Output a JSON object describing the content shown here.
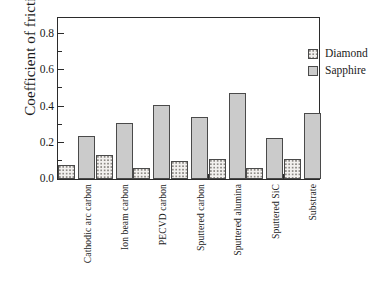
{
  "chart_data": {
    "type": "bar",
    "title": "",
    "xlabel": "",
    "ylabel": "Coefficient of friction",
    "ylim": [
      0.0,
      0.9
    ],
    "grid": false,
    "legend_position": "top-right",
    "ytick_labels": [
      "0.0",
      "0.2",
      "0.4",
      "0.6",
      "0.8"
    ],
    "ytick_values": [
      0.0,
      0.2,
      0.4,
      0.6,
      0.8
    ],
    "yminor_values": [
      0.1,
      0.3,
      0.5,
      0.7
    ],
    "categories": [
      "Cathodic arc carbon",
      "Ion beam carbon",
      "PECVD carbon",
      "Sputtered carbon",
      "Sputtered alumina",
      "Sputtered SiC",
      "Substrate"
    ],
    "series": [
      {
        "name": "Diamond",
        "color": "#f2f0ee",
        "pattern": "stippled",
        "values": [
          0.08,
          0.13,
          0.06,
          0.1,
          0.11,
          0.06,
          0.11
        ]
      },
      {
        "name": "Sapphire",
        "color": "#cbcbcb",
        "pattern": "solid",
        "values": [
          0.24,
          0.31,
          0.41,
          0.345,
          0.475,
          0.225,
          0.365
        ]
      }
    ]
  },
  "legend": {
    "items": [
      {
        "label": "Diamond"
      },
      {
        "label": "Sapphire"
      }
    ]
  },
  "axis": {
    "y_title": "Coefficient of friction"
  }
}
